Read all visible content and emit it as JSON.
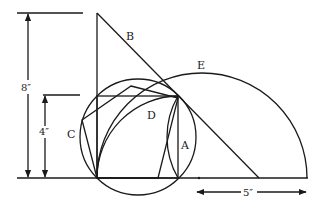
{
  "diagram": {
    "labels": {
      "A": "A",
      "B": "B",
      "C": "C",
      "D": "D",
      "E": "E"
    },
    "dimensions": {
      "height_total": "8″",
      "height_half": "4″",
      "radius": "5″"
    },
    "colors": {
      "stroke": "#1a1a1a",
      "background": "#ffffff"
    }
  }
}
